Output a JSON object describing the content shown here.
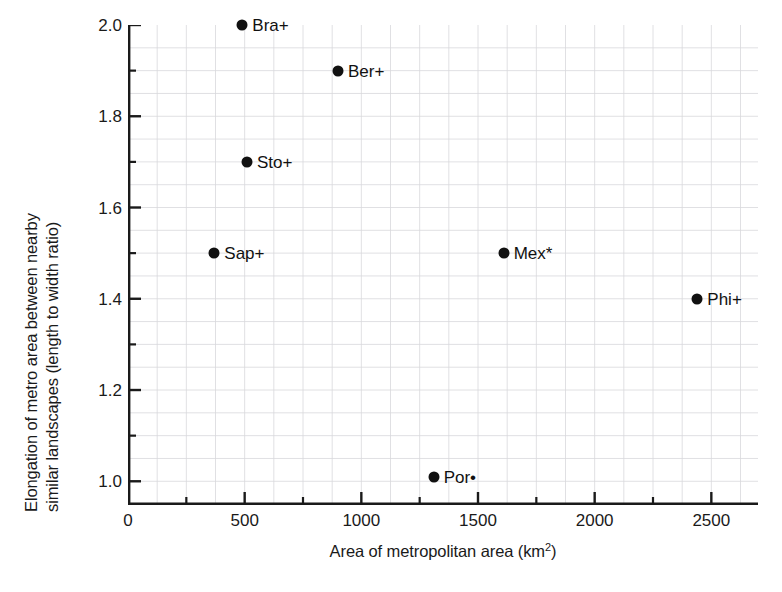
{
  "chart_data": {
    "type": "scatter",
    "title": "",
    "xlabel": "Area of metropolitan area (km2)",
    "xlabel_main": "Area of metropolitan area (km",
    "xlabel_sup": "2",
    "xlabel_tail": ")",
    "ylabel_line1": "Elongation of metro area between nearby",
    "ylabel_line2": "similar landscapes (length to width ratio)",
    "xlim": [
      0,
      2700
    ],
    "ylim": [
      0.948,
      2.0
    ],
    "xticks": [
      0,
      500,
      1000,
      1500,
      2000,
      2500
    ],
    "xtick_labels": [
      "0",
      "500",
      "1000",
      "1500",
      "2000",
      "2500"
    ],
    "xminor_step": 125,
    "yticks": [
      1.0,
      1.2,
      1.4,
      1.6,
      1.8,
      2.0
    ],
    "ytick_labels": [
      "1.0",
      "1.2",
      "1.4",
      "1.6",
      "1.8",
      "2.0"
    ],
    "yminor_step": 0.05,
    "grid": true,
    "grid_color": "#d8d8dc",
    "axis_color": "#1a1a1a",
    "marker_color": "#111111",
    "legend": "none",
    "points": [
      {
        "label": "Bra+",
        "x": 490,
        "y": 2.0,
        "label_side": "right"
      },
      {
        "label": "Ber+",
        "x": 900,
        "y": 1.9,
        "label_side": "right"
      },
      {
        "label": "Sto+",
        "x": 510,
        "y": 1.7,
        "label_side": "right"
      },
      {
        "label": "Sap+",
        "x": 370,
        "y": 1.5,
        "label_side": "right"
      },
      {
        "label": "Mex*",
        "x": 1610,
        "y": 1.5,
        "label_side": "right"
      },
      {
        "label": "Phi+",
        "x": 2440,
        "y": 1.4,
        "label_side": "right"
      },
      {
        "label": "Por•",
        "x": 1310,
        "y": 1.01,
        "label_side": "right"
      }
    ]
  }
}
